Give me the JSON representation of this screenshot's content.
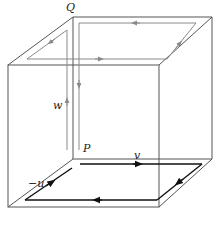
{
  "diagram": {
    "type": "cube-with-loops",
    "labels": {
      "Q": "Q",
      "P": "P",
      "w": "w",
      "v": "v",
      "neg_u": "−u"
    },
    "colors": {
      "cube_edge": "#555555",
      "grey_loop": "#8a8a8a",
      "black_loop": "#111111",
      "background": "#ffffff"
    }
  }
}
